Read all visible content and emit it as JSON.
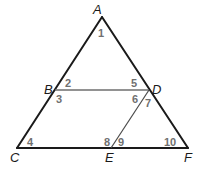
{
  "figure": {
    "colors": {
      "outline": "#1a1a1a",
      "inner_segments": "#6e6e6e",
      "vertex_text": "#1a1a1a",
      "angle_text": "#707070"
    },
    "vertices": {
      "A": {
        "label": "A",
        "x": 102,
        "y": 17
      },
      "B": {
        "label": "B",
        "x": 55,
        "y": 90
      },
      "C": {
        "label": "C",
        "x": 17,
        "y": 148
      },
      "D": {
        "label": "D",
        "x": 149,
        "y": 90
      },
      "E": {
        "label": "E",
        "x": 111,
        "y": 148
      },
      "F": {
        "label": "F",
        "x": 188,
        "y": 148
      }
    },
    "segments": [
      {
        "from": "A",
        "to": "C",
        "style": "outline"
      },
      {
        "from": "A",
        "to": "F",
        "style": "outline"
      },
      {
        "from": "C",
        "to": "F",
        "style": "outline"
      },
      {
        "from": "B",
        "to": "D",
        "style": "inner"
      },
      {
        "from": "D",
        "to": "E",
        "style": "inner"
      }
    ],
    "angles": [
      {
        "number": "1",
        "vertex": "A"
      },
      {
        "number": "2",
        "vertex": "B"
      },
      {
        "number": "3",
        "vertex": "B"
      },
      {
        "number": "4",
        "vertex": "C"
      },
      {
        "number": "5",
        "vertex": "D"
      },
      {
        "number": "6",
        "vertex": "D"
      },
      {
        "number": "7",
        "vertex": "D"
      },
      {
        "number": "8",
        "vertex": "E"
      },
      {
        "number": "9",
        "vertex": "E"
      },
      {
        "number": "10",
        "vertex": "F"
      }
    ]
  }
}
